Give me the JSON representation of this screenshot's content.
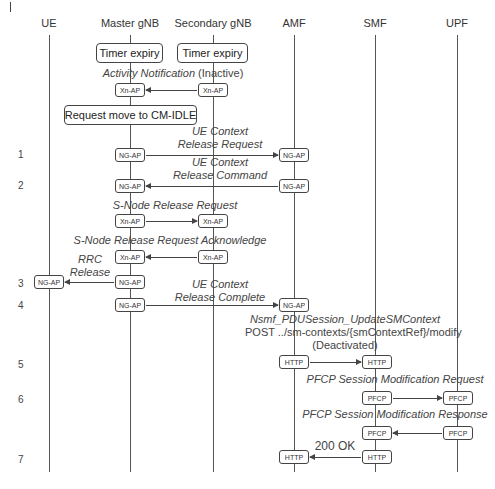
{
  "diagram": {
    "type": "sequence",
    "entities": [
      {
        "id": "ue",
        "label": "UE"
      },
      {
        "id": "mgnb",
        "label": "Master gNB"
      },
      {
        "id": "sgnb",
        "label": "Secondary gNB"
      },
      {
        "id": "amf",
        "label": "AMF"
      },
      {
        "id": "smf",
        "label": "SMF"
      },
      {
        "id": "upf",
        "label": "UPF"
      }
    ],
    "events": {
      "timer_master": "Timer expiry",
      "timer_secondary": "Timer expiry",
      "request_idle": "Request move to CM-IDLE"
    },
    "messages": [
      {
        "label": "Activity Notification",
        "suffix": "(Inactive)",
        "from": "sgnb",
        "to": "mgnb",
        "protocol": "Xn-AP"
      },
      {
        "step": "1",
        "label_line1": "UE Context",
        "label_line2": "Release Request",
        "from": "mgnb",
        "to": "amf",
        "protocol": "NG-AP"
      },
      {
        "step": "2",
        "label_line1": "UE Context",
        "label_line2": "Release Command",
        "from": "amf",
        "to": "mgnb",
        "protocol": "NG-AP"
      },
      {
        "label": "S-Node Release Request",
        "from": "mgnb",
        "to": "sgnb",
        "protocol": "Xn-AP"
      },
      {
        "label": "S-Node Release Request Acknowledge",
        "from": "sgnb",
        "to": "mgnb",
        "protocol": "Xn-AP"
      },
      {
        "step": "3",
        "label_line1": "RRC",
        "label_line2": "Release",
        "from": "mgnb",
        "to": "ue",
        "protocol": "NG-AP"
      },
      {
        "step": "4",
        "label_line1": "UE Context",
        "label_line2": "Release Complete",
        "from": "mgnb",
        "to": "amf",
        "protocol": "NG-AP"
      },
      {
        "step": "5",
        "label_line1": "Nsmf_PDUSession_UpdateSMContext",
        "label_line2": "POST ../sm-contexts/{smContextRef}/modify",
        "label_line3": "(Deactivated)",
        "from": "amf",
        "to": "smf",
        "protocol": "HTTP"
      },
      {
        "step": "6",
        "label": "PFCP Session Modification Request",
        "from": "smf",
        "to": "upf",
        "protocol": "PFCP"
      },
      {
        "label": "PFCP Session Modification Response",
        "from": "upf",
        "to": "smf",
        "protocol": "PFCP"
      },
      {
        "step": "7",
        "label": "200 OK",
        "from": "smf",
        "to": "amf",
        "protocol": "HTTP"
      }
    ]
  }
}
